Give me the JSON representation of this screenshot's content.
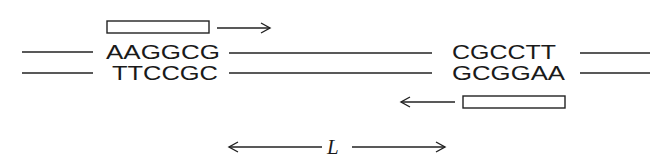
{
  "diagram": {
    "type": "dna-primer-binding",
    "top_strand": {
      "left_site": "AAGGCG",
      "right_site": "CGCCTT"
    },
    "bottom_strand": {
      "left_site": "TTCCGC",
      "right_site": "GCGGAA"
    },
    "primers": [
      {
        "position": "top-left",
        "direction": "right"
      },
      {
        "position": "bottom-right",
        "direction": "left"
      }
    ],
    "distance_label": "L",
    "colors": {
      "ink": "#222222",
      "background": "#ffffff"
    }
  }
}
